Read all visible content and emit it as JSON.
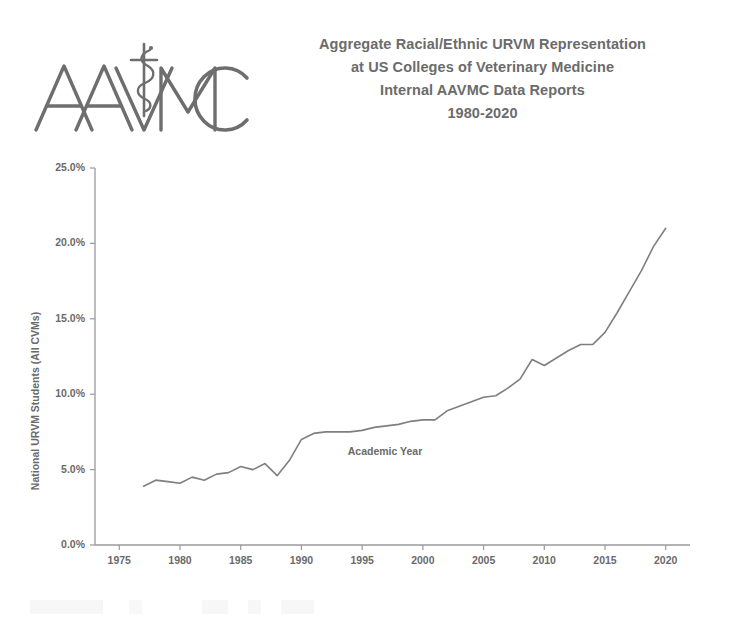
{
  "logo": {
    "name": "aavmc-logo",
    "text": "AAVMC",
    "symbol": "rod-of-asclepius",
    "color": "#6e6e6e"
  },
  "title": {
    "lines": [
      "Aggregate Racial/Ethnic URVM Representation",
      "at US Colleges of Veterinary Medicine",
      "Internal AAVMC Data Reports",
      "1980-2020"
    ]
  },
  "chart_data": {
    "type": "line",
    "title": "Aggregate Racial/Ethnic URVM Representation at US Colleges of Veterinary Medicine",
    "subtitle": "Internal AAVMC Data Reports 1980-2020",
    "xlabel": "Academic Year",
    "ylabel": "National URVM Students (All CVMs)",
    "xlim": [
      1973,
      2022
    ],
    "ylim": [
      0,
      25
    ],
    "grid": false,
    "legend": false,
    "line_color": "#7f7f7f",
    "line_width": 1.6,
    "y_ticks": [
      0,
      5,
      10,
      15,
      20,
      25
    ],
    "y_tick_labels": [
      "0.0%",
      "5.0%",
      "10.0%",
      "15.0%",
      "20.0%",
      "25.0%"
    ],
    "x_ticks": [
      1975,
      1980,
      1985,
      1990,
      1995,
      2000,
      2005,
      2010,
      2015,
      2020
    ],
    "x_tick_labels": [
      "1975",
      "1980",
      "1985",
      "1990",
      "1995",
      "2000",
      "2005",
      "2010",
      "2015",
      "2020"
    ],
    "series": [
      {
        "name": "National URVM Students (All CVMs)",
        "x": [
          1977,
          1978,
          1979,
          1980,
          1981,
          1982,
          1983,
          1984,
          1985,
          1986,
          1987,
          1988,
          1989,
          1990,
          1991,
          1992,
          1993,
          1994,
          1995,
          1996,
          1997,
          1998,
          1999,
          2000,
          2001,
          2002,
          2003,
          2004,
          2005,
          2006,
          2007,
          2008,
          2009,
          2010,
          2011,
          2012,
          2013,
          2014,
          2015,
          2016,
          2017,
          2018,
          2019,
          2020
        ],
        "values": [
          3.9,
          4.3,
          4.2,
          4.1,
          4.5,
          4.3,
          4.7,
          4.8,
          5.2,
          5.0,
          5.4,
          4.6,
          5.6,
          7.0,
          7.4,
          7.5,
          7.5,
          7.5,
          7.6,
          7.8,
          7.9,
          8.0,
          8.2,
          8.3,
          8.3,
          8.9,
          9.2,
          9.5,
          9.8,
          9.9,
          10.4,
          11.0,
          12.3,
          11.9,
          12.4,
          12.9,
          13.3,
          13.3,
          14.1,
          15.4,
          16.8,
          18.2,
          19.8,
          21.0
        ]
      }
    ]
  }
}
